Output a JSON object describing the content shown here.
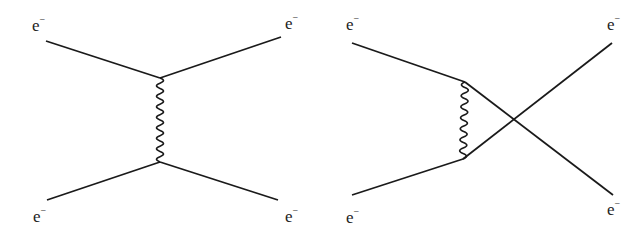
{
  "diagram": {
    "type": "feynman",
    "line_color": "#1a1a1a",
    "background": "#ffffff",
    "panels": [
      {
        "name": "t-channel",
        "labels": [
          {
            "id": "in-top",
            "base": "e",
            "sup": "−",
            "x": 32,
            "y": 15
          },
          {
            "id": "out-top",
            "base": "e",
            "sup": "−",
            "x": 285,
            "y": 15
          },
          {
            "id": "in-bottom",
            "base": "e",
            "sup": "−",
            "x": 33,
            "y": 207
          },
          {
            "id": "out-bottom",
            "base": "e",
            "sup": "−",
            "x": 285,
            "y": 207
          }
        ],
        "fermion_lines": [
          {
            "id": "incoming-top",
            "from": [
              46,
              41
            ],
            "to": [
              160,
              78
            ]
          },
          {
            "id": "outgoing-top",
            "from": [
              160,
              78
            ],
            "to": [
              281,
              37
            ]
          },
          {
            "id": "incoming-bottom",
            "from": [
              47,
              200
            ],
            "to": [
              160,
              162
            ]
          },
          {
            "id": "outgoing-bottom",
            "from": [
              160,
              162
            ],
            "to": [
              278,
              200
            ]
          }
        ],
        "photon": {
          "from": [
            160,
            78
          ],
          "to": [
            160,
            162
          ],
          "wiggles": 8
        }
      },
      {
        "name": "u-channel",
        "labels": [
          {
            "id": "in-top",
            "base": "e",
            "sup": "−",
            "x": 346,
            "y": 15
          },
          {
            "id": "out-top",
            "base": "e",
            "sup": "−",
            "x": 607,
            "y": 15
          },
          {
            "id": "in-bottom",
            "base": "e",
            "sup": "−",
            "x": 346,
            "y": 207
          },
          {
            "id": "out-bottom",
            "base": "e",
            "sup": "−",
            "x": 607,
            "y": 200
          }
        ],
        "fermion_lines": [
          {
            "id": "incoming-top",
            "from": [
              352,
              43
            ],
            "to": [
              465,
              82
            ]
          },
          {
            "id": "incoming-bottom",
            "from": [
              352,
              195
            ],
            "to": [
              463,
              159
            ]
          },
          {
            "id": "crossed-down",
            "from": [
              465,
              82
            ],
            "to": [
              613,
              195
            ]
          },
          {
            "id": "crossed-up",
            "from": [
              463,
              159
            ],
            "to": [
              612,
              43
            ]
          }
        ],
        "photon": {
          "from": [
            465,
            82
          ],
          "to": [
            463,
            159
          ],
          "wiggles": 7
        }
      }
    ]
  },
  "text": {
    "electron_label": "e",
    "electron_sup": "−"
  }
}
